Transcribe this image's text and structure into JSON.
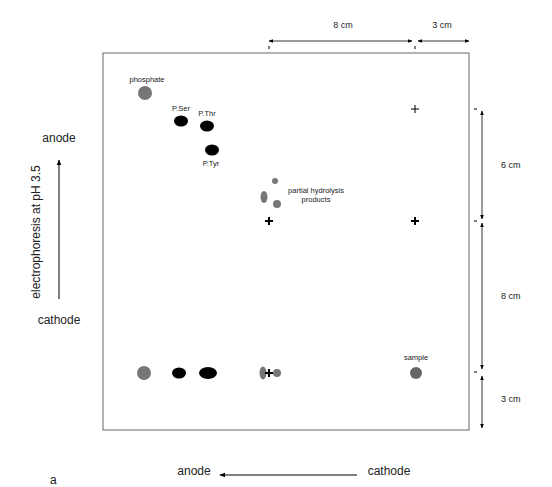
{
  "figure": {
    "panel_label": "a",
    "vertical_axis": {
      "title": "electrophoresis at pH 3.5",
      "top_label": "anode",
      "bottom_label": "cathode"
    },
    "horizontal_axis": {
      "left_label": "anode",
      "right_label": "cathode"
    },
    "dimensions": {
      "top_first": "8 cm",
      "top_second": "3 cm",
      "right_first": "6 cm",
      "right_second": "8 cm",
      "right_third": "3 cm"
    },
    "spot_labels": {
      "phosphate": "phosphate",
      "pser": "P.Ser",
      "pthr": "P.Thr",
      "ptyr": "P.Tyr",
      "partial_line1": "partial hydrolysis",
      "partial_line2": "products",
      "sample": "sample"
    },
    "colors": {
      "grey_spot": "#777777",
      "black_spot": "#000000",
      "box": "#666666"
    }
  }
}
